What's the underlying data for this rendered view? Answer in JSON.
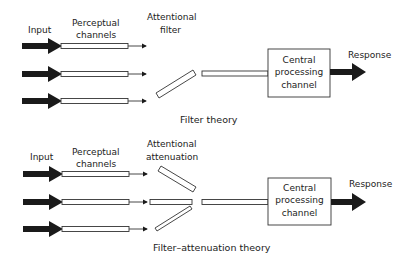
{
  "diagrams": [
    {
      "id": "filter",
      "caption": "Filter theory",
      "labels": {
        "input": "Input",
        "perceptual_1": "Perceptual",
        "perceptual_2": "channels",
        "attentional_1": "Attentional",
        "attentional_2": "filter",
        "central_1": "Central",
        "central_2": "processing",
        "central_3": "channel",
        "response": "Response"
      },
      "input_channels": 3,
      "passed_channel": "top"
    },
    {
      "id": "attenuation",
      "caption": "Filter–attenuation theory",
      "labels": {
        "input": "Input",
        "perceptual_1": "Perceptual",
        "perceptual_2": "channels",
        "attentional_1": "Attentional",
        "attentional_2": "attenuation",
        "central_1": "Central",
        "central_2": "processing",
        "central_3": "channel",
        "response": "Response"
      },
      "input_channels": 3,
      "passed_channel": "middle"
    }
  ],
  "colors": {
    "stroke": "#333333",
    "arrow_fill": "#1a1a1a",
    "background": "#ffffff"
  }
}
